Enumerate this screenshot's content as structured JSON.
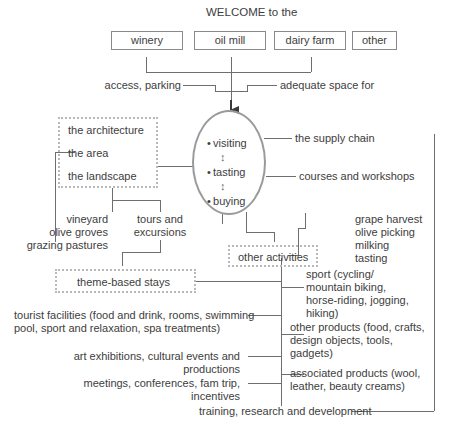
{
  "diagram": {
    "title": "WELCOME to the",
    "top_boxes": [
      {
        "label": "winery"
      },
      {
        "label": "oil mill"
      },
      {
        "label": "dairy farm"
      },
      {
        "label": "other"
      }
    ],
    "requirements": {
      "left": "access, parking",
      "right": "adequate space for"
    },
    "context_box": {
      "items": [
        "the architecture",
        "the area",
        "the landscape"
      ]
    },
    "core": {
      "items": [
        "visiting",
        "tasting",
        "buying"
      ],
      "connector": "↕"
    },
    "right_top": {
      "supply_chain": "the supply chain",
      "courses": "courses and workshops"
    },
    "left_mid": {
      "places": "vineyard\nolive groves\ngrazing pastures",
      "tours": "tours and\nexcursions"
    },
    "experiences": {
      "items": "grape harvest\nolive picking\nmilking\ntasting"
    },
    "other_activities_box": {
      "label": "other activities"
    },
    "stays_box": {
      "label": "theme-based stays"
    },
    "right_items": [
      {
        "label": "sport (cycling/\nmountain biking,\nhorse-riding, jogging,\nhiking)"
      },
      {
        "label": "other products (food, crafts,\ndesign objects, tools,\ngadgets)"
      },
      {
        "label": "associated products (wool,\nleather, beauty creams)"
      }
    ],
    "left_items": [
      {
        "label": "tourist facilities (food and drink, rooms, swimming\npool, sport and relaxation, spa treatments)"
      },
      {
        "label": "art exhibitions, cultural events and\nproductions"
      },
      {
        "label": "meetings, conferences, fam trip,\nincentives"
      }
    ],
    "bottom": {
      "label": "training, research and development"
    },
    "colors": {
      "line": "#6e6e6e",
      "dotted": "#b9b9b9",
      "ellipse": "#9a9a9a",
      "text": "#3d3d3d",
      "box_border": "#8a8a8a"
    }
  }
}
